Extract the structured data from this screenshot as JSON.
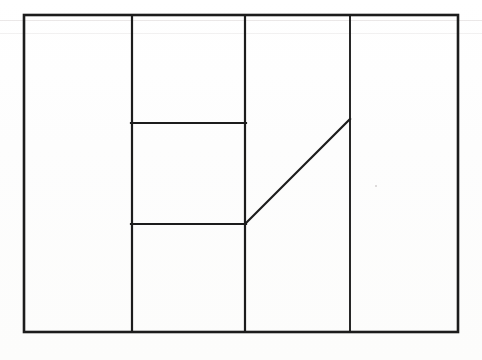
{
  "document": {
    "kind": "line-drawing",
    "title": "",
    "caption": "",
    "background_color": "#fdfdfc",
    "ink_color": "#1c1c1c"
  },
  "figure": {
    "name": "partitioned-rectangle-diagram",
    "canvas": {
      "width": 482,
      "height": 360
    },
    "stroke": {
      "color": "#1c1c1c",
      "outer_width": 2.6,
      "inner_width": 2.2,
      "linecap": "square"
    },
    "outer_rectangle": {
      "label": "outer-boundary",
      "x": 24,
      "y": 15,
      "width": 434,
      "height": 317,
      "right": 458,
      "bottom": 332
    },
    "vertical_dividers": [
      {
        "label": "divider-1",
        "x": 132,
        "y1": 15,
        "y2": 332
      },
      {
        "label": "divider-2",
        "x": 245,
        "y1": 15,
        "y2": 332
      },
      {
        "label": "divider-3",
        "x": 350,
        "y1": 15,
        "y2": 332
      }
    ],
    "horizontal_segments": [
      {
        "label": "upper-crossbar",
        "x1": 132,
        "x2": 245,
        "y": 123
      },
      {
        "label": "lower-crossbar",
        "x1": 132,
        "x2": 245,
        "y": 224
      }
    ],
    "diagonals": [
      {
        "label": "rising-diagonal",
        "x1": 245,
        "y1": 224,
        "x2": 350,
        "y2": 119
      }
    ],
    "regions": [
      {
        "label": "region-left-column"
      },
      {
        "label": "region-upper-middle"
      },
      {
        "label": "region-center-middle"
      },
      {
        "label": "region-lower-middle"
      },
      {
        "label": "region-diagonal-wedge"
      },
      {
        "label": "region-right-column"
      }
    ],
    "artifacts": [
      {
        "label": "scan-streak-top",
        "y": 20
      },
      {
        "label": "scan-streak-upper",
        "y": 33
      },
      {
        "label": "scan-speck",
        "x": 375,
        "y": 185
      }
    ]
  }
}
